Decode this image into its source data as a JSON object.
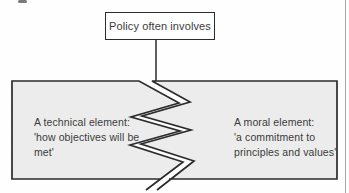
{
  "figure": {
    "top_box": {
      "label": "Policy often involves"
    },
    "torn_box": {
      "left_panel": {
        "lines": [
          "A technical element:",
          "'how objectives will be",
          "met'"
        ]
      },
      "right_panel": {
        "lines": [
          "A moral element:",
          "'a commitment to",
          "principles and values'"
        ]
      }
    }
  },
  "colors": {
    "panel-fill": "#ececec",
    "stroke": "#2b2b2b",
    "text": "#3b3b3b",
    "page-edge": "#a8a8a8",
    "background": "#fefefe"
  }
}
